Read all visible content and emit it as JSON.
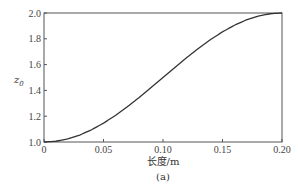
{
  "chart_data": {
    "type": "line",
    "title": "",
    "caption": "(a)",
    "xlabel": "长度/m",
    "ylabel": "z",
    "ylabel_subscript": "0",
    "xlim": [
      0,
      0.2
    ],
    "ylim": [
      1.0,
      2.0
    ],
    "grid": false,
    "legend": null,
    "x_ticks": [
      0,
      0.05,
      0.1,
      0.15,
      0.2
    ],
    "x_tick_labels": [
      "0",
      "0.05",
      "0.10",
      "0.15",
      "0.20"
    ],
    "y_ticks": [
      1.0,
      1.2,
      1.4,
      1.6,
      1.8,
      2.0
    ],
    "y_tick_labels": [
      "1.0",
      "1.2",
      "1.4",
      "1.6",
      "1.8",
      "2.0"
    ],
    "series": [
      {
        "name": "z0",
        "color": "#333333",
        "x": [
          0,
          0.01,
          0.02,
          0.03,
          0.04,
          0.05,
          0.06,
          0.07,
          0.08,
          0.09,
          0.1,
          0.11,
          0.12,
          0.13,
          0.14,
          0.15,
          0.16,
          0.17,
          0.18,
          0.19,
          0.2
        ],
        "y": [
          1.0,
          1.006,
          1.024,
          1.054,
          1.095,
          1.146,
          1.206,
          1.273,
          1.345,
          1.422,
          1.5,
          1.578,
          1.655,
          1.727,
          1.794,
          1.854,
          1.905,
          1.946,
          1.976,
          1.994,
          2.0
        ]
      }
    ]
  }
}
